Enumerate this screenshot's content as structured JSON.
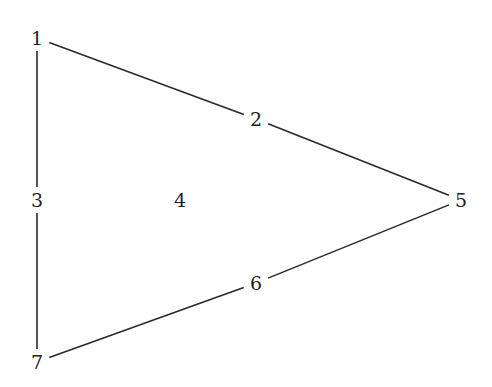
{
  "diagram": {
    "type": "graph",
    "width": 492,
    "height": 387,
    "colors": {
      "edge": "#2a2a2a",
      "label": "#222222",
      "background": "#ffffff"
    },
    "nodes": [
      {
        "id": "1",
        "label": "1",
        "x": 37,
        "y": 38
      },
      {
        "id": "2",
        "label": "2",
        "x": 256,
        "y": 119
      },
      {
        "id": "3",
        "label": "3",
        "x": 37,
        "y": 200
      },
      {
        "id": "4",
        "label": "4",
        "x": 180,
        "y": 200
      },
      {
        "id": "5",
        "label": "5",
        "x": 461,
        "y": 200
      },
      {
        "id": "6",
        "label": "6",
        "x": 256,
        "y": 283
      },
      {
        "id": "7",
        "label": "7",
        "x": 37,
        "y": 362
      }
    ],
    "edges": [
      {
        "from": "1",
        "to": "2"
      },
      {
        "from": "2",
        "to": "5"
      },
      {
        "from": "5",
        "to": "6"
      },
      {
        "from": "6",
        "to": "7"
      },
      {
        "from": "1",
        "to": "3"
      },
      {
        "from": "3",
        "to": "7"
      }
    ]
  }
}
